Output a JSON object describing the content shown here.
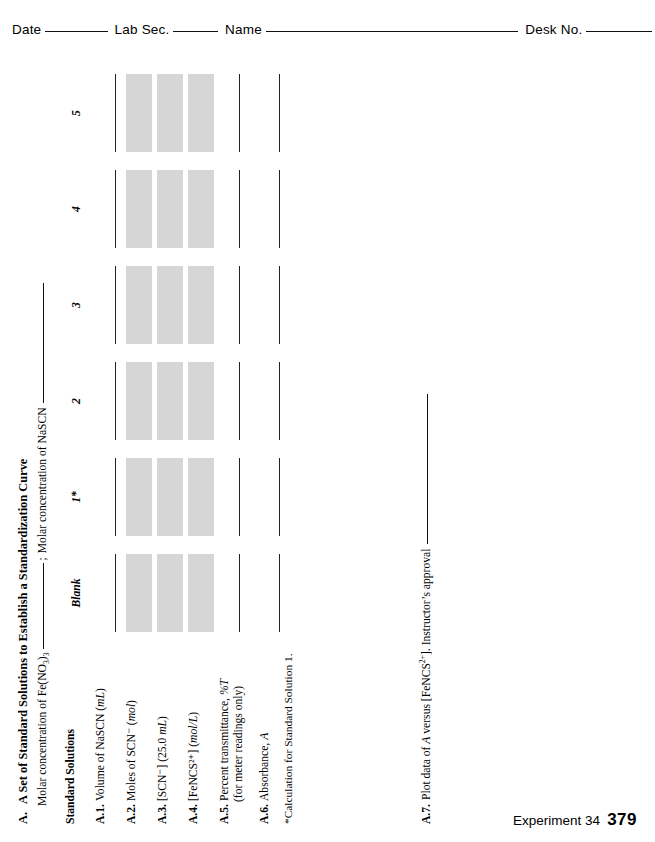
{
  "page": {
    "footer_label": "Experiment 34",
    "footer_page": "379"
  },
  "header": {
    "date_label": "Date",
    "lab_sec_label": "Lab Sec.",
    "name_label": "Name",
    "desk_no_label": "Desk No.",
    "date_value": "",
    "lab_sec_value": "",
    "name_value": "",
    "desk_no_value": ""
  },
  "section": {
    "letter": "A.",
    "title": "A Set of Standard Solutions to Establish a Standardization Curve",
    "sub_line_1": "Molar concentration of Fe(NO",
    "sub_line_1_sub_a": "3",
    "sub_line_1_mid": ")",
    "sub_line_1_sub_b": "3",
    "sub_line_2_sep": ";",
    "sub_line_2": "Molar concentration of NaSCN",
    "fe_value": "",
    "nascn_value": ""
  },
  "table": {
    "row_header_label": "Standard Solutions",
    "columns": [
      {
        "label": "Blank"
      },
      {
        "label": "1*"
      },
      {
        "label": "2"
      },
      {
        "label": "3"
      },
      {
        "label": "4"
      },
      {
        "label": "5"
      }
    ],
    "rows": [
      {
        "num": "A.1.",
        "text": "Volume of NaSCN (",
        "unit_italic": "mL",
        "text_tail": ")",
        "style": "line",
        "sub": "",
        "values": [
          "",
          "",
          "",
          "",
          "",
          ""
        ]
      },
      {
        "num": "A.2.",
        "text": "Moles of SCN⁻ (",
        "unit_italic": "mol",
        "text_tail": ")",
        "style": "shade",
        "sub": "",
        "values": [
          "",
          "",
          "",
          "",
          "",
          ""
        ]
      },
      {
        "num": "A.3.",
        "text": "[SCN⁻] (25.0 ",
        "unit_italic": "mL",
        "text_tail": ")",
        "style": "shade",
        "sub": "",
        "values": [
          "",
          "",
          "",
          "",
          "",
          ""
        ]
      },
      {
        "num": "A.4.",
        "text": "[FeNCS²⁺] (",
        "unit_italic": "mol/L",
        "text_tail": ")",
        "style": "shade",
        "sub": "",
        "values": [
          "",
          "",
          "",
          "",
          "",
          ""
        ]
      },
      {
        "num": "A.5.",
        "text": "Percent transmittance, ",
        "unit_italic": "%T",
        "text_tail": "",
        "style": "line",
        "sub": "(for meter readings only)",
        "values": [
          "",
          "",
          "",
          "",
          "",
          ""
        ]
      },
      {
        "num": "A.6.",
        "text": "Absorbance, ",
        "unit_italic": "A",
        "text_tail": "",
        "style": "line",
        "sub": "",
        "values": [
          "",
          "",
          "",
          "",
          "",
          ""
        ]
      }
    ],
    "footnote": "*Calculation for Standard Solution 1."
  },
  "item_a7": {
    "num": "A.7.",
    "text_a": "Plot data of ",
    "text_a_italic": "A",
    "text_b": " versus [FeNCS",
    "charge": "2+",
    "text_c": "]. Instructor’s approval",
    "value": ""
  },
  "colors": {
    "ink": "#000000",
    "rule": "#111111",
    "shade": "#d6d6d6"
  }
}
